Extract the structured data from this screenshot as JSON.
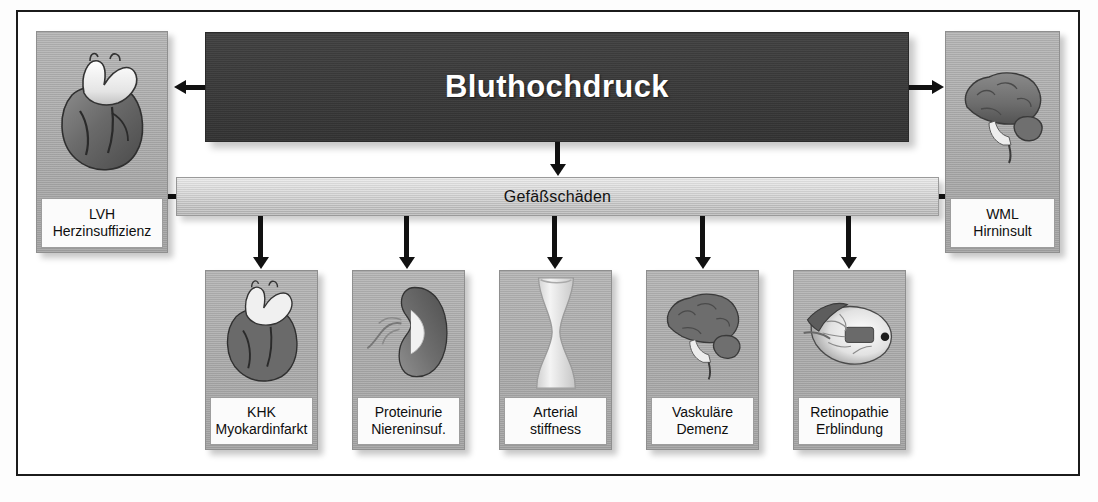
{
  "diagram": {
    "title": "Bluthochdruck",
    "subtitle": "Gefäßschäden",
    "side_panels": [
      {
        "icon": "heart-icon",
        "line1": "LVH",
        "line2": "Herzinsuffizienz",
        "side": "left"
      },
      {
        "icon": "brain-icon",
        "line1": "WML",
        "line2": "Hirninsult",
        "side": "right"
      }
    ],
    "outcome_panels": [
      {
        "icon": "heart-icon",
        "line1": "KHK",
        "line2": "Myokardinfarkt"
      },
      {
        "icon": "kidney-icon",
        "line1": "Proteinurie",
        "line2": "Niereninsuf."
      },
      {
        "icon": "artery-icon",
        "line1": "Arterial",
        "line2": "stiffness"
      },
      {
        "icon": "brain-icon",
        "line1": "Vaskuläre",
        "line2": "Demenz"
      },
      {
        "icon": "eye-icon",
        "line1": "Retinopathie",
        "line2": "Erblindung"
      }
    ],
    "colors": {
      "title_bar": "#3a3a3a",
      "title_text": "#ffffff",
      "vessel_bar": "#cfcfcf",
      "panel_bg": "#a9a9a9",
      "caption_bg": "#fbfbfb",
      "arrow": "#111111",
      "frame_border": "#1b1b1b"
    }
  }
}
